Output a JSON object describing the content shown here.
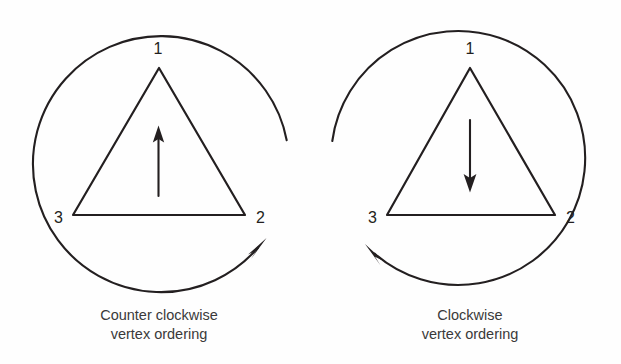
{
  "figure": {
    "background_color": "#fefefe",
    "ink_color": "#231f20",
    "caption_color": "#3a3a3a",
    "panels": [
      {
        "id": "counter-clockwise",
        "vertex_labels": [
          "1",
          "2",
          "3"
        ],
        "vertex_label_1": "1",
        "vertex_label_2": "2",
        "vertex_label_3": "3",
        "caption_line_1": "Counter clockwise",
        "caption_line_2": "vertex ordering",
        "normal_direction": "up",
        "rotation_direction": "counter-clockwise",
        "circle": {
          "cx": 159,
          "cy": 158,
          "r": 128
        },
        "triangle": {
          "apex": [
            159,
            68
          ],
          "left": [
            73,
            215
          ],
          "right": [
            245,
            215
          ]
        },
        "normal_arrow": {
          "x": 158,
          "y_tail": 196,
          "y_tip": 126
        },
        "arc": {
          "start_angle_deg": -8,
          "end_angle_deg": 186,
          "sweep": "clockwise-drawn"
        }
      },
      {
        "id": "clockwise",
        "vertex_labels": [
          "1",
          "2",
          "3"
        ],
        "vertex_label_1": "1",
        "vertex_label_2": "2",
        "vertex_label_3": "3",
        "caption_line_1": "Clockwise",
        "caption_line_2": "vertex ordering",
        "normal_direction": "down",
        "rotation_direction": "clockwise",
        "circle": {
          "cx": 470,
          "cy": 158,
          "r": 127
        },
        "triangle": {
          "apex": [
            470,
            68
          ],
          "left": [
            387,
            215
          ],
          "right": [
            555,
            215
          ]
        },
        "normal_arrow": {
          "x": 470,
          "y_tail": 120,
          "y_tip": 192
        },
        "arc": {
          "start_angle_deg": 188,
          "end_angle_deg": 404,
          "sweep": "counter-clockwise-drawn"
        }
      }
    ]
  }
}
